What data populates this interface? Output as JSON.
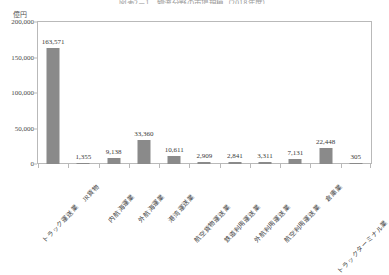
{
  "chart_data": {
    "type": "bar",
    "title": "図表2－1　物流分野の市場規模（2018年度）",
    "unit_label": "億円",
    "ylabel": "",
    "xlabel": "",
    "ylim": [
      0,
      200000
    ],
    "yticks": [
      0,
      50000,
      100000,
      150000,
      200000
    ],
    "ytick_labels": [
      "0",
      "50,000",
      "100,000",
      "150,000",
      "200,000"
    ],
    "grid": false,
    "legend": "none",
    "bar_color": "#8a8a8a",
    "categories": [
      "トラック運送業",
      "JR貨物",
      "内航海運業",
      "外航海運業",
      "港湾運送業",
      "航空貨物運送業",
      "鉄道利用運送業",
      "外航利用運送業",
      "航空利用運送業",
      "倉庫業",
      "トラックターミナル業"
    ],
    "values": [
      163571,
      1355,
      9138,
      33360,
      10611,
      2909,
      2841,
      3311,
      7131,
      22448,
      305
    ],
    "value_labels": [
      "163,571",
      "1,355",
      "9,138",
      "33,360",
      "10,611",
      "2,909",
      "2,841",
      "3,311",
      "7,131",
      "22,448",
      "305"
    ]
  }
}
